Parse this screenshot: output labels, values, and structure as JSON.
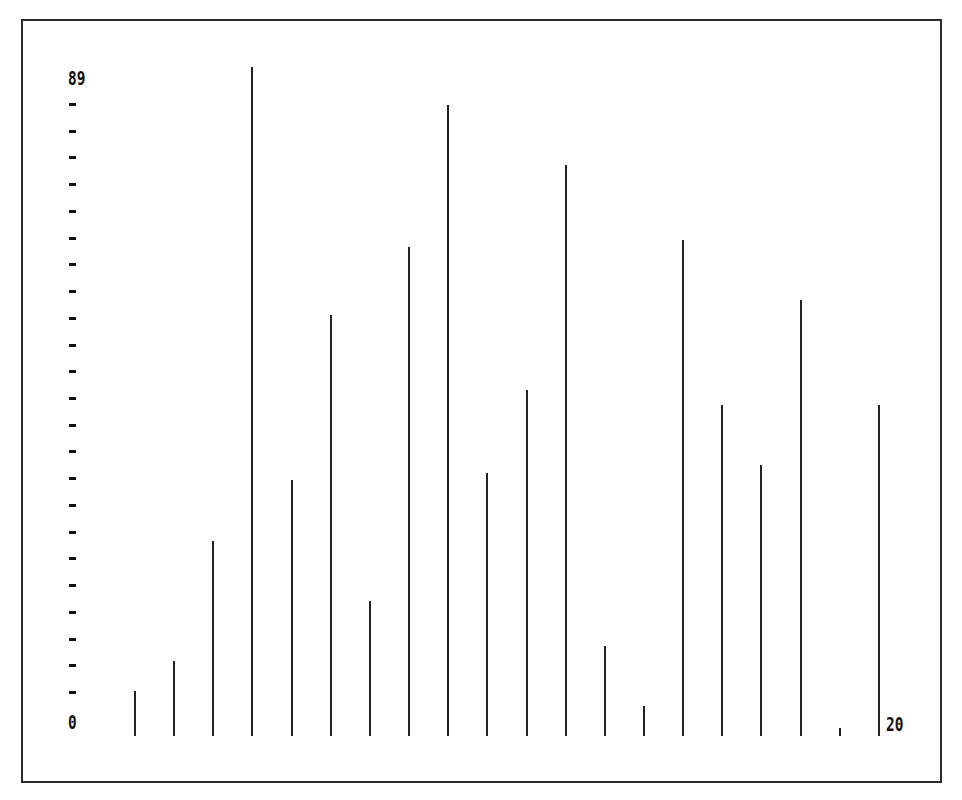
{
  "chart": {
    "y_max_label": "89",
    "y_min_label": "0",
    "x_max_label": "20"
  },
  "chart_data": {
    "type": "bar",
    "title": "",
    "xlabel": "",
    "ylabel": "",
    "categories": [
      1,
      2,
      3,
      4,
      5,
      6,
      7,
      8,
      9,
      10,
      11,
      12,
      13,
      14,
      15,
      16,
      17,
      18,
      19,
      20
    ],
    "values": [
      6,
      10,
      26,
      89,
      34,
      56,
      18,
      65,
      84,
      35,
      46,
      76,
      12,
      4,
      66,
      44,
      36,
      58,
      1,
      44
    ],
    "ylim": [
      0,
      89
    ],
    "xlim": [
      0,
      20
    ],
    "y_tick_labels": [
      "0",
      "89"
    ],
    "x_tick_labels": [
      "0",
      "20"
    ],
    "y_minor_ticks": 23,
    "grid": false,
    "legend": null,
    "style": "thin vertical lines (spike/needle plot), black on white, framed"
  },
  "colors": {
    "background": "#ffffff",
    "ink": "#222222"
  }
}
